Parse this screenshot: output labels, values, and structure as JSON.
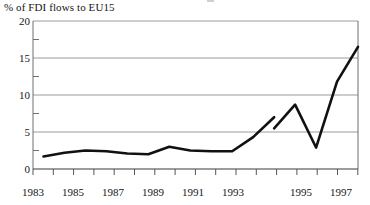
{
  "chart_data": {
    "type": "line",
    "title": "% of FDI flows to EU15",
    "xlabel": "",
    "ylabel": "% of FDI flows to EU15",
    "ylim": [
      0,
      20
    ],
    "yticks": [
      0,
      5,
      10,
      15,
      20
    ],
    "yminor_ticks": [
      2.5,
      7.5,
      12.5,
      17.5
    ],
    "grid": "horizontal",
    "legend": "none",
    "xlim": [
      1982.5,
      1998.0
    ],
    "xtick_labels": [
      "1983",
      "1985",
      "1987",
      "1989",
      "1991",
      "1993",
      "1995",
      "1997"
    ],
    "xtick_values": [
      1983,
      1985,
      1987,
      1989,
      1991,
      1993,
      1995,
      1997
    ],
    "series": [
      {
        "name": "FDI flows to EU15 (first period)",
        "x": [
          1983,
          1984,
          1985,
          1986,
          1987,
          1988,
          1989,
          1990,
          1991,
          1992,
          1993,
          1994
        ],
        "values": [
          1.7,
          2.2,
          2.5,
          2.4,
          2.1,
          2.0,
          3.0,
          2.5,
          2.4,
          2.4,
          4.3,
          7.0
        ]
      },
      {
        "name": "FDI flows to EU15 (second period)",
        "x": [
          1994,
          1995,
          1996,
          1997,
          1998
        ],
        "values": [
          5.5,
          8.7,
          2.9,
          11.8,
          16.5
        ]
      }
    ],
    "break_note": "Series is discontinuous: line breaks between 1994 and 1995",
    "line_color": "#111111",
    "grid_color": "#9a9a9a",
    "frame_color": "#6f6f6f"
  },
  "colors": {
    "line": "#111111",
    "grid": "#9a9a9a",
    "frame": "#6f6f6f",
    "background": "#ffffff",
    "text": "#151515"
  },
  "ylabels": {
    "t0": "0",
    "t5": "5",
    "t10": "10",
    "t15": "15",
    "t20": "20"
  },
  "xlabels": {
    "x1983": "1983",
    "x1985": "1985",
    "x1987": "1987",
    "x1989": "1989",
    "x1991": "1991",
    "x1993": "1993",
    "x1995": "1995",
    "x1997": "1997"
  },
  "header": {
    "title": "% of FDI flows to EU15"
  }
}
